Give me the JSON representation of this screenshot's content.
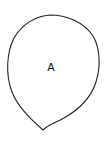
{
  "diagram": {
    "shape": "teardrop",
    "label": "A",
    "stroke_color": "#222222",
    "fill_color": "#ffffff"
  }
}
